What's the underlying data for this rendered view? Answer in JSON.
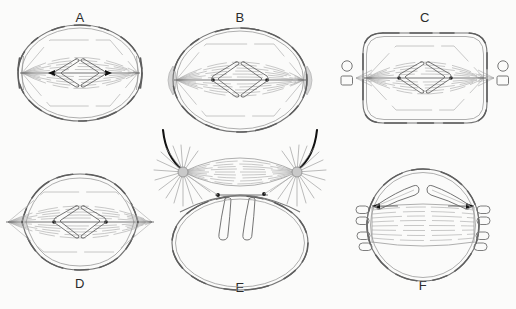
{
  "figure": {
    "background_color": "#fbfbfa",
    "line_color": "#6d6d6d",
    "accent_dark": "#111111",
    "centrosome_color": "#d6d6d6"
  },
  "panels": [
    {
      "id": "A",
      "label": "A",
      "label_position": "top",
      "cell_shape": "rounded-oval",
      "center_x": 80,
      "center_y": 73,
      "radius_x": 62,
      "radius_y": 48,
      "features": [
        "double-layer cell membrane with dashed texture",
        "barrel-shaped spindle fibers pole to pole",
        "two V-shaped chromosomes at metaphase plate",
        "horizontal pole-to-pole axis with arrowheads",
        "thickened polar membrane caps"
      ],
      "chromosome_count": 2,
      "has_centrosome_blob": false,
      "has_external_organelles": false,
      "has_aster": false
    },
    {
      "id": "B",
      "label": "B",
      "label_position": "top",
      "cell_shape": "oval",
      "center_x": 240,
      "center_y": 80,
      "radius_x": 67,
      "radius_y": 52,
      "features": [
        "grey centrosome blob outside each pole",
        "spindle fibers converging to poles",
        "two V-shaped chromosomes at equator",
        "horizontal axis with arrowheads and kinetochore dots"
      ],
      "chromosome_count": 2,
      "has_centrosome_blob": true,
      "has_external_organelles": false,
      "has_aster": false
    },
    {
      "id": "C",
      "label": "C",
      "label_position": "top",
      "cell_shape": "squared-oval",
      "center_x": 425,
      "center_y": 78,
      "radius_x": 62,
      "radius_y": 45,
      "features": [
        "small circle organelle above each pole outside membrane",
        "rounded-square organelle below each pole outside membrane",
        "short radiating fibers crossing the membrane at poles",
        "two V-shaped chromosomes at equator"
      ],
      "chromosome_count": 2,
      "has_centrosome_blob": false,
      "has_external_organelles": true,
      "external_organelle_shapes": [
        "circle",
        "rounded-square"
      ],
      "has_aster": false
    },
    {
      "id": "D",
      "label": "D",
      "label_position": "bottom",
      "cell_shape": "lens-pointed-oval",
      "center_x": 80,
      "center_y": 222,
      "radius_x": 58,
      "radius_y": 48,
      "features": [
        "pointed lens-shaped cell with sharp poles",
        "spindle fibers extending past the cell tips",
        "two V-shaped chromosomes at equator",
        "kinetochore dots on the axis"
      ],
      "chromosome_count": 2,
      "has_centrosome_blob": false,
      "has_external_organelles": false,
      "has_aster": false
    },
    {
      "id": "E",
      "label": "E",
      "label_position": "bottom",
      "cell_shape": "oval-with-external-spindle",
      "center_x": 240,
      "center_y": 243,
      "radius_x": 68,
      "radius_y": 47,
      "features": [
        "two radiating asters with grey centres above the cell",
        "bold dark arcs curving from upper left and upper right into each aster",
        "lens-shaped spindle between the asters",
        "two club-shaped chromosomes hanging from the spindle midline into the cell",
        "large empty oval cell body below"
      ],
      "chromosome_count": 2,
      "has_centrosome_blob": false,
      "has_external_organelles": false,
      "has_aster": true,
      "aster_count": 2
    },
    {
      "id": "F",
      "label": "F",
      "label_position": "bottom",
      "cell_shape": "circle",
      "center_x": 423,
      "center_y": 225,
      "radius_x": 58,
      "radius_y": 55,
      "features": [
        "circular cell with double-line membrane",
        "wide barrel-shaped spindle spanning the cell",
        "two elongated chromosomes above the spindle angled toward poles",
        "dark arrow segments at each spindle pole",
        "small capsule organelles clustered outside each pole"
      ],
      "chromosome_count": 2,
      "has_centrosome_blob": false,
      "has_external_organelles": true,
      "external_organelle_shapes": [
        "capsule"
      ],
      "has_aster": false
    }
  ]
}
